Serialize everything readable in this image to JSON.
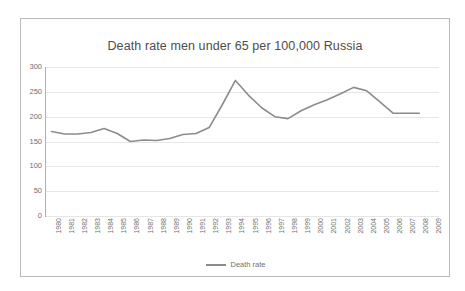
{
  "chart_data": {
    "type": "line",
    "title": "Death rate men under 65 per 100,000 Russia",
    "xlabel": "",
    "ylabel": "",
    "ylim": [
      0,
      300
    ],
    "yticks": [
      0,
      50,
      100,
      150,
      200,
      250,
      300
    ],
    "grid": true,
    "legend_position": "bottom",
    "line_color": "#8c8c8c",
    "categories": [
      "1980",
      "1981",
      "1982",
      "1983",
      "1984",
      "1985",
      "1986",
      "1987",
      "1988",
      "1989",
      "1990",
      "1991",
      "1992",
      "1993",
      "1994",
      "1995",
      "1996",
      "1997",
      "1998",
      "1999",
      "2000",
      "2001",
      "2002",
      "2003",
      "2004",
      "2005",
      "2006",
      "2007",
      "2008",
      "2009"
    ],
    "series": [
      {
        "name": "Death rate",
        "values": [
          170,
          165,
          165,
          168,
          176,
          166,
          150,
          153,
          152,
          156,
          164,
          166,
          178,
          224,
          273,
          243,
          218,
          200,
          196,
          212,
          224,
          234,
          246,
          259,
          252,
          230,
          207,
          207,
          207,
          null
        ]
      }
    ]
  },
  "chart": {
    "title": "Death rate men under 65 per 100,000 Russia",
    "legend": {
      "series_label": "Death rate"
    },
    "y_axis": {
      "ticks": [
        "300",
        "250",
        "200",
        "150",
        "100",
        "50",
        "0"
      ]
    },
    "x_axis": {
      "ticks": [
        "1980",
        "1981",
        "1982",
        "1983",
        "1984",
        "1985",
        "1986",
        "1987",
        "1988",
        "1989",
        "1990",
        "1991",
        "1992",
        "1993",
        "1994",
        "1995",
        "1996",
        "1997",
        "1998",
        "1999",
        "2000",
        "2001",
        "2002",
        "2003",
        "2004",
        "2005",
        "2006",
        "2007",
        "2008",
        "2009"
      ]
    },
    "colors": {
      "line": "#8c8c8c",
      "grid": "#e6e6e6",
      "axis": "#b0b0b0",
      "text": "#6f6f6f",
      "title_text": "#4d4d4d",
      "border": "#b9b9b9",
      "background": "#ffffff"
    }
  }
}
